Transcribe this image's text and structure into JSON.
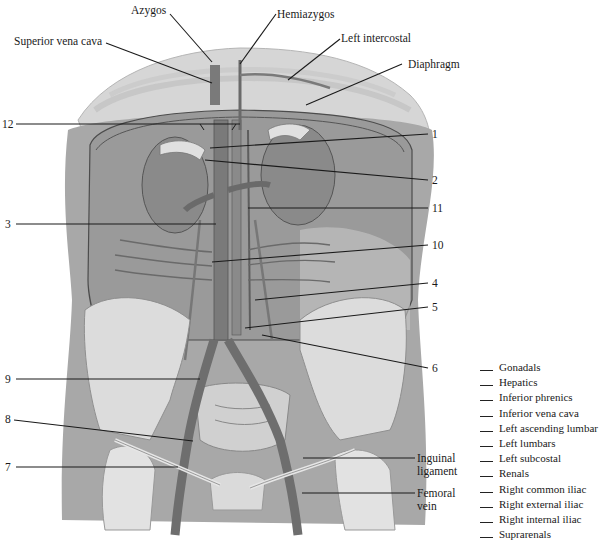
{
  "diagram": {
    "colors": {
      "background": "#ffffff",
      "tissue_dark": "#8e8e8e",
      "tissue_mid": "#a9a9a9",
      "tissue_light": "#cfcfcf",
      "bone": "#dedede",
      "vessel": "#6e6e6e",
      "leader_line": "#1a1a1a"
    },
    "named_labels": [
      {
        "id": "azygos",
        "text": "Azygos"
      },
      {
        "id": "hemiazygos",
        "text": "Hemiazygos"
      },
      {
        "id": "superior-vena-cava",
        "text": "Superior vena cava"
      },
      {
        "id": "left-intercostal",
        "text": "Left intercostal"
      },
      {
        "id": "diaphragm",
        "text": "Diaphragm"
      },
      {
        "id": "inguinal-ligament",
        "text": "Inguinal ligament"
      },
      {
        "id": "femoral-vein",
        "text": "Femoral vein"
      }
    ],
    "numbered_labels": {
      "left_side": [
        "12",
        "3",
        "9",
        "8",
        "7"
      ],
      "right_side": [
        "1",
        "2",
        "11",
        "10",
        "4",
        "5",
        "6"
      ]
    },
    "answer_bank": [
      "Gonadals",
      "Hepatics",
      "Inferior phrenics",
      "Inferior vena cava",
      "Left ascending lumbar",
      "Left lumbars",
      "Left subcostal",
      "Renals",
      "Right common iliac",
      "Right external iliac",
      "Right internal iliac",
      "Suprarenals"
    ]
  }
}
